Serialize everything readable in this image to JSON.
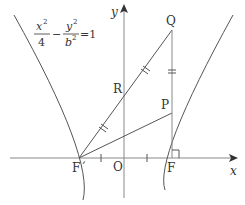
{
  "equation": {
    "x_num": "x",
    "x_exp": "2",
    "x_den": "4",
    "minus": "−",
    "y_num": "y",
    "y_exp": "2",
    "y_den": "b",
    "y_den_exp": "2",
    "equals": "=1"
  },
  "axes": {
    "x_label": "x",
    "y_label": "y",
    "origin_label": "O"
  },
  "points": {
    "Q": "Q",
    "P": "P",
    "R": "R",
    "F": "F",
    "F_prime": "F´"
  },
  "colors": {
    "stroke": "#555555",
    "axis": "#888888",
    "text": "#333333"
  }
}
